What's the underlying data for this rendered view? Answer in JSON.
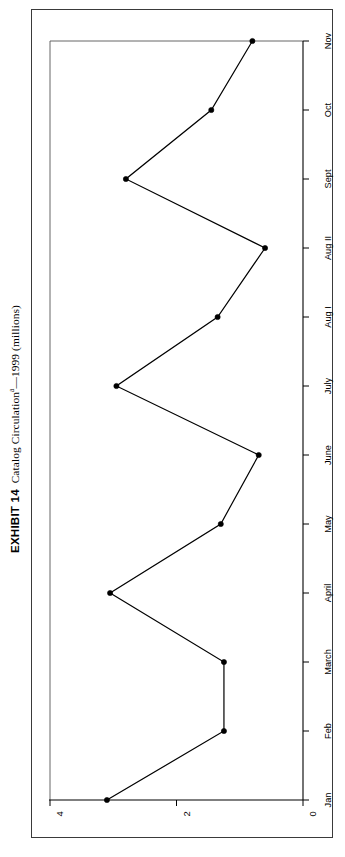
{
  "exhibit": {
    "number_label": "EXHIBIT 14",
    "title_text": "Catalog Circulation",
    "title_superscript": "a",
    "title_suffix": "—1999 (millions)",
    "full_title": "EXHIBIT 14  Catalog Circulationa—1999 (millions)"
  },
  "chart_data": {
    "type": "line",
    "orientation": "rotated-90-ccw",
    "xlabel": "",
    "ylabel": "",
    "categories": [
      "Jan",
      "Feb",
      "March",
      "April",
      "May",
      "June",
      "July",
      "Aug I",
      "Aug II",
      "Sept",
      "Oct",
      "Nov"
    ],
    "values": [
      3.1,
      1.25,
      1.25,
      3.05,
      1.3,
      0.7,
      2.95,
      1.35,
      0.6,
      2.8,
      1.45,
      0.8
    ],
    "value_ticks": [
      "0",
      "2",
      "4"
    ],
    "value_tick_values": [
      0,
      2,
      4
    ],
    "ylim": [
      0,
      4
    ],
    "grid": false,
    "legend": "none",
    "marker": "filled-triangle-dot",
    "line_color": "#000000",
    "marker_color": "#000000"
  },
  "axis": {
    "category_axis_name": "month-axis",
    "value_axis_name": "circulation-axis"
  }
}
